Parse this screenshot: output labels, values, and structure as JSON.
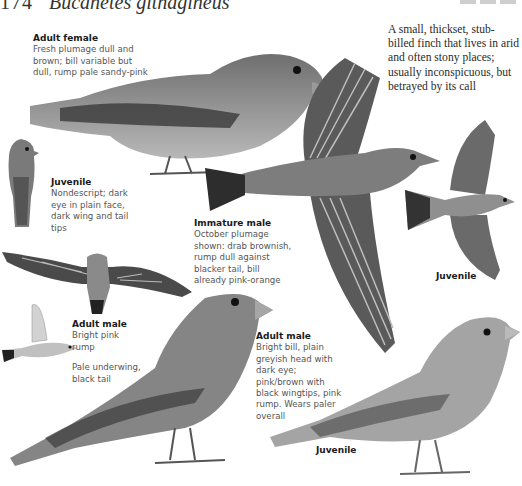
{
  "page": {
    "number": "174",
    "species": "Bucanetes githagineus",
    "intro": "A small, thickset, stub-billed finch that lives in arid and often stony places; usually inconspicuous, but betrayed by its call"
  },
  "captions": [
    {
      "id": "adult-female",
      "title": "Adult female",
      "text": "Fresh plumage dull and brown; bill variable but dull, rump pale sandy-pink"
    },
    {
      "id": "juvenile-perched",
      "title": "Juvenile",
      "text": "Nondescript; dark eye in plain face, dark wing and tail tips"
    },
    {
      "id": "immature-male",
      "title": "Immature male",
      "text": "October plumage shown: drab brownish, rump dull against blacker tail, bill already pink-orange"
    },
    {
      "id": "adult-male-flight",
      "title": "Adult male",
      "text": "Bright pink rump",
      "text2": "Pale underwing, black tail"
    },
    {
      "id": "adult-male-perched",
      "title": "Adult male",
      "text": "Bright bill, plain greyish head with dark eye; pink/brown with black wingtips, pink rump. Wears paler overall"
    }
  ],
  "labels": {
    "juvenile_flight": "Juvenile",
    "juvenile_bottom": "Juvenile"
  },
  "palette": {
    "ink": "#1a1a1a",
    "body_grey": "#8a8a8a",
    "dark_grey": "#3a3a3a",
    "light_grey": "#c4c4c4"
  }
}
